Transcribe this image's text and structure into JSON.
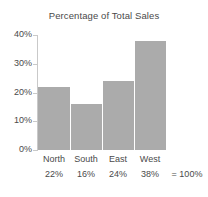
{
  "chart_data": {
    "type": "bar",
    "title": "Percentage of Total Sales",
    "xlabel": "",
    "ylabel": "",
    "categories": [
      "North",
      "South",
      "East",
      "West"
    ],
    "values": [
      22,
      16,
      24,
      38
    ],
    "value_labels": [
      "22%",
      "16%",
      "24%",
      "38%"
    ],
    "ylim": [
      0,
      40
    ],
    "yticks": [
      0,
      10,
      20,
      30,
      40
    ],
    "ytick_labels": [
      "0%",
      "10%",
      "20%",
      "30%",
      "40%"
    ],
    "grid": false,
    "legend": "none",
    "bar_color": "#ababab",
    "axis_color": "#c9c9c9",
    "text_color": "#4a4a4a",
    "background_color": "#ffffff",
    "total_equals_sign": "=",
    "total_label": "100%"
  }
}
